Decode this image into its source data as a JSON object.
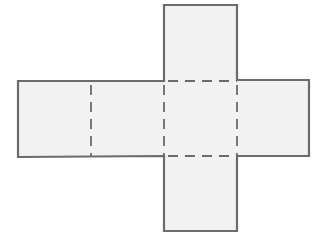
{
  "diagram": {
    "type": "cube-net",
    "colors": {
      "stroke": "#6b6b6b",
      "fill": "#f2f2f2",
      "background": "#ffffff"
    },
    "faces": [
      {
        "id": "top",
        "x": 164,
        "y": 5,
        "w": 73,
        "h": 76
      },
      {
        "id": "left",
        "x": 18,
        "y": 81,
        "w": 73,
        "h": 75
      },
      {
        "id": "mid-left",
        "x": 91,
        "y": 81,
        "w": 73,
        "h": 75
      },
      {
        "id": "center",
        "x": 164,
        "y": 81,
        "w": 73,
        "h": 75
      },
      {
        "id": "right",
        "x": 237,
        "y": 80,
        "w": 72,
        "h": 76
      },
      {
        "id": "bottom",
        "x": 164,
        "y": 156,
        "w": 73,
        "h": 75
      }
    ],
    "fold_lines": [
      {
        "id": "fold-left-midleft",
        "x1": 91,
        "y1": 81,
        "x2": 91,
        "y2": 156
      },
      {
        "id": "fold-midleft-center",
        "x1": 164,
        "y1": 81,
        "x2": 164,
        "y2": 156
      },
      {
        "id": "fold-center-right",
        "x1": 237,
        "y1": 81,
        "x2": 237,
        "y2": 156
      },
      {
        "id": "fold-top-center",
        "x1": 164,
        "y1": 81,
        "x2": 237,
        "y2": 81
      },
      {
        "id": "fold-center-bottom",
        "x1": 164,
        "y1": 156,
        "x2": 237,
        "y2": 156
      }
    ]
  }
}
